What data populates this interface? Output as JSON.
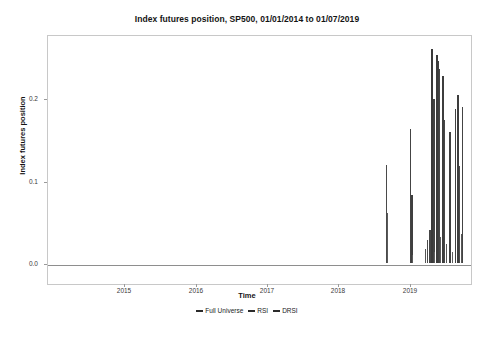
{
  "chart_data": {
    "type": "line",
    "title": "Index futures position, SP500, 01/01/2014 to 01/07/2019",
    "xlabel": "Time",
    "ylabel": "Index futures position",
    "xlim": [
      "2014-01-01",
      "2019-07-01"
    ],
    "ylim": [
      -0.015,
      0.275
    ],
    "grid": false,
    "legend_position": "bottom-center",
    "yticks": [
      "0.0",
      "0.1",
      "0.2"
    ],
    "ytick_values": [
      0.0,
      0.1,
      0.2
    ],
    "xticks": [
      "2015",
      "2016",
      "2017",
      "2018",
      "2019"
    ],
    "xtick_values": [
      2015,
      2016,
      2017,
      2018,
      2019
    ],
    "series": [
      {
        "name": "Full Universe",
        "color": "#3d3d3d",
        "points": [
          {
            "x": 2018.33,
            "y": 0.118
          },
          {
            "x": 2018.62,
            "y": 0.165
          },
          {
            "x": 2018.96,
            "y": 0.262
          },
          {
            "x": 2019.04,
            "y": 0.252
          },
          {
            "x": 2019.21,
            "y": 0.205
          }
        ]
      },
      {
        "name": "RSI",
        "color": "#4a4a4a",
        "points": [
          {
            "x": 2018.62,
            "y": 0.102
          },
          {
            "x": 2018.9,
            "y": 0.04
          },
          {
            "x": 2018.99,
            "y": 0.232
          },
          {
            "x": 2019.08,
            "y": 0.152
          },
          {
            "x": 2019.17,
            "y": 0.198
          }
        ]
      },
      {
        "name": "DRSI",
        "color": "#555555",
        "points": [
          {
            "x": 2018.88,
            "y": 0.018
          },
          {
            "x": 2018.92,
            "y": 0.03
          },
          {
            "x": 2019.01,
            "y": 0.196
          },
          {
            "x": 2019.1,
            "y": 0.14
          },
          {
            "x": 2019.19,
            "y": 0.032
          }
        ]
      }
    ],
    "spikes": [
      {
        "x": 385,
        "top": 166,
        "w": 1.4,
        "c": "#4a4a4a"
      },
      {
        "x": 386,
        "top": 214,
        "w": 1.2,
        "c": "#5a5a5a"
      },
      {
        "x": 409,
        "top": 130,
        "w": 1.3,
        "c": "#444444"
      },
      {
        "x": 410,
        "top": 196,
        "w": 1.6,
        "c": "#3f3f3f"
      },
      {
        "x": 411,
        "top": 256,
        "w": 1.2,
        "c": "#5a5a5a"
      },
      {
        "x": 424,
        "top": 250,
        "w": 1.4,
        "c": "#555555"
      },
      {
        "x": 426,
        "top": 241,
        "w": 1.3,
        "c": "#4d4d4d"
      },
      {
        "x": 428,
        "top": 231,
        "w": 1.5,
        "c": "#454545"
      },
      {
        "x": 430,
        "top": 50,
        "w": 1.6,
        "c": "#3a3a3a"
      },
      {
        "x": 432,
        "top": 100,
        "w": 1.5,
        "c": "#434343"
      },
      {
        "x": 433,
        "top": 253,
        "w": 1.2,
        "c": "#5c5c5c"
      },
      {
        "x": 435,
        "top": 56,
        "w": 1.5,
        "c": "#3c3c3c"
      },
      {
        "x": 437,
        "top": 62,
        "w": 1.4,
        "c": "#414141"
      },
      {
        "x": 438,
        "top": 70,
        "w": 1.3,
        "c": "#464646"
      },
      {
        "x": 439,
        "top": 238,
        "w": 1.2,
        "c": "#5a5a5a"
      },
      {
        "x": 441,
        "top": 77,
        "w": 1.5,
        "c": "#3e3e3e"
      },
      {
        "x": 443,
        "top": 121,
        "w": 1.4,
        "c": "#474747"
      },
      {
        "x": 445,
        "top": 245,
        "w": 1.3,
        "c": "#555555"
      },
      {
        "x": 448,
        "top": 133,
        "w": 1.6,
        "c": "#3f3f3f"
      },
      {
        "x": 451,
        "top": 253,
        "w": 1.2,
        "c": "#5e5e5e"
      },
      {
        "x": 454,
        "top": 110,
        "w": 1.4,
        "c": "#424242"
      },
      {
        "x": 456,
        "top": 96,
        "w": 1.5,
        "c": "#3d3d3d"
      },
      {
        "x": 458,
        "top": 167,
        "w": 1.3,
        "c": "#4b4b4b"
      },
      {
        "x": 460,
        "top": 235,
        "w": 1.2,
        "c": "#585858"
      },
      {
        "x": 461,
        "top": 108,
        "w": 1.4,
        "c": "#444444"
      }
    ]
  },
  "legend": {
    "items": [
      {
        "label": "Full Universe",
        "color": "#2b2b2b"
      },
      {
        "label": "RSI",
        "color": "#2b2b2b"
      },
      {
        "label": "DRSI",
        "color": "#2b2b2b"
      }
    ]
  }
}
